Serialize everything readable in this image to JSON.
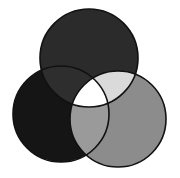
{
  "diagram": {
    "type": "venn-3",
    "background": "#ffffff",
    "stroke": "#111111",
    "stroke_width": 1.6,
    "circles": [
      {
        "id": "top",
        "cx": 89,
        "cy": 58,
        "r": 49,
        "fill": "#2b2b2b"
      },
      {
        "id": "left",
        "cx": 61,
        "cy": 114,
        "r": 48,
        "fill": "#151515"
      },
      {
        "id": "right",
        "cx": 118,
        "cy": 119,
        "r": 48,
        "fill": "#8c8c8c"
      }
    ],
    "regions": {
      "top_left": "#2e2e2e",
      "top_right": "#dadada",
      "left_right": "#9a9a9a",
      "center": "#ffffff"
    }
  }
}
